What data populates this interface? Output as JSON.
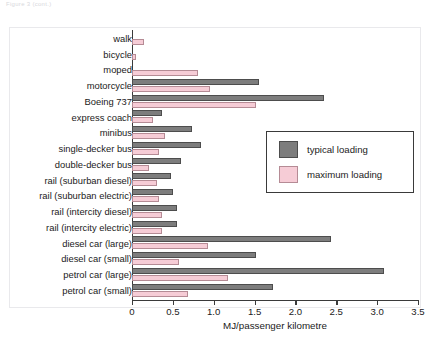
{
  "figure": {
    "caption": "Figure 3 (cont.)"
  },
  "legend": {
    "position": "inside-right-upper",
    "entries": [
      {
        "label": "typical loading",
        "color": "#7d7d7d",
        "swatch": "typical"
      },
      {
        "label": "maximum loading",
        "color": "#f6ccd6",
        "swatch": "maximum"
      }
    ]
  },
  "chart_data": {
    "type": "bar",
    "orientation": "horizontal",
    "title": "",
    "subtitle": "",
    "xlabel": "MJ/passenger kilometre",
    "ylabel": "",
    "xlim": [
      0,
      3.5
    ],
    "ylim": null,
    "grid": false,
    "xticks": [
      "0",
      "0.5",
      "1.0",
      "1.5",
      "2.0",
      "2.5",
      "3.0",
      "3.5"
    ],
    "xtick_values": [
      0,
      0.5,
      1.0,
      1.5,
      2.0,
      2.5,
      3.0,
      3.5
    ],
    "categories": [
      "walk",
      "bicycle",
      "moped",
      "motorcycle",
      "Boeing 737",
      "express coach",
      "minibus",
      "single-decker bus",
      "double-decker bus",
      "rail (suburban diesel)",
      "rail (suburban electric)",
      "rail (intercity diesel)",
      "rail (intercity electric)",
      "diesel car (large)",
      "diesel car (small)",
      "petrol car (large)",
      "petrol car (small)"
    ],
    "series": [
      {
        "name": "typical loading",
        "color": "#7d7d7d",
        "values": [
          0,
          0,
          0,
          1.55,
          2.35,
          0.37,
          0.73,
          0.85,
          0.6,
          0.48,
          0.5,
          0.55,
          0.55,
          2.43,
          1.52,
          3.08,
          1.73
        ]
      },
      {
        "name": "maximum loading",
        "color": "#f6ccd6",
        "values": [
          0.15,
          0.05,
          0.81,
          0.96,
          1.52,
          0.26,
          0.4,
          0.33,
          0.21,
          0.3,
          0.33,
          0.37,
          0.37,
          0.93,
          0.57,
          1.18,
          0.68
        ]
      }
    ],
    "annotations": []
  }
}
